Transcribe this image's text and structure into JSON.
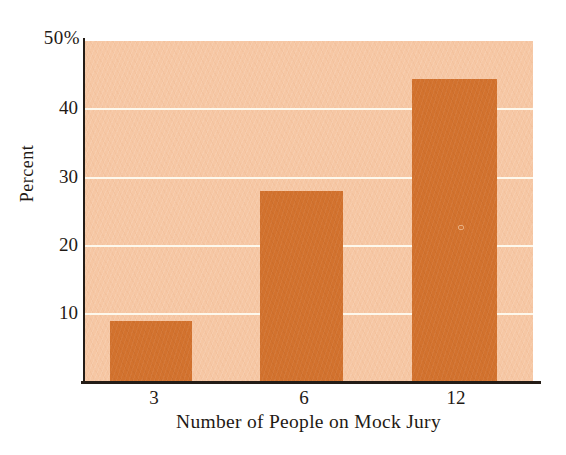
{
  "chart_data": {
    "type": "bar",
    "title": "",
    "categories": [
      "3",
      "6",
      "12"
    ],
    "values": [
      9,
      28,
      44.5
    ],
    "xlabel": "Number of People on Mock Jury",
    "ylabel": "Percent",
    "ylim": [
      0,
      50
    ],
    "ytick_labels": [
      "10",
      "20",
      "30",
      "40"
    ],
    "ymax_label": "50%",
    "grid": "horizontal white gridlines at 10, 20, 30, 40; plot top edge equals 50%",
    "legend_position": "none",
    "colors": {
      "bar": "#d2722e",
      "plot_background": "#f6c7a4",
      "gridline": "#fdf8ec",
      "axis_line": "#241c16",
      "text": "#1f1a15",
      "page_background": "#ffffff"
    }
  }
}
